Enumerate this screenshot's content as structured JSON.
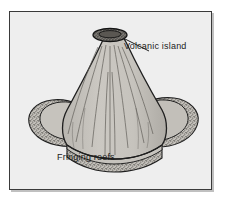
{
  "figure": {
    "kind": "line-drawing",
    "frame_border_color": "#3a3a3a",
    "background_color": "#eeeeee"
  },
  "labels": {
    "volcanic_island": "Volcanic island",
    "fringing_reefs": "Fringing reefs"
  },
  "artwork": {
    "cone_fill": "#c9c6c0",
    "cone_shadow_fill": "#b4b1ab",
    "reef_fill": "#bdbab4",
    "crater_fill": "#6e6b66",
    "ink_color": "#1f1f1f",
    "leader_line": "from label to summit crater"
  }
}
